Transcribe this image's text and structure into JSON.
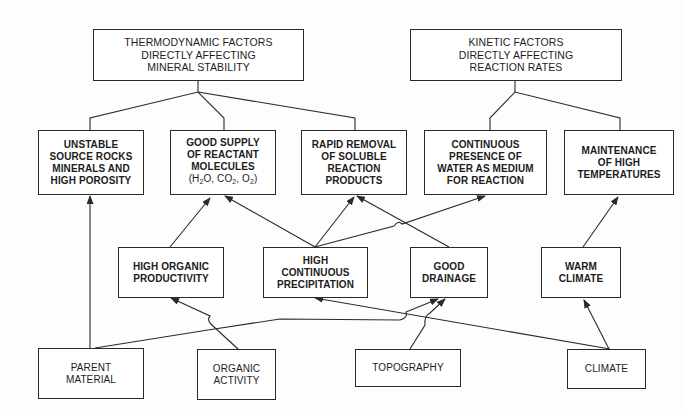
{
  "diagram": {
    "colors": {
      "line": "#2a2a2a",
      "text": "#1c1c1c",
      "background": "#fdfdfb"
    },
    "top": [
      {
        "id": "thermo",
        "lines": [
          "THERMODYNAMIC FACTORS",
          "DIRECTLY AFFECTING",
          "MINERAL STABILITY"
        ]
      },
      {
        "id": "kinetic",
        "lines": [
          "KINETIC FACTORS",
          "DIRECTLY AFFECTING",
          "REACTION RATES"
        ]
      }
    ],
    "factors": [
      {
        "id": "unstable",
        "lines": [
          "UNSTABLE",
          "SOURCE ROCKS",
          "MINERALS AND",
          "HIGH POROSITY"
        ]
      },
      {
        "id": "supply",
        "lines": [
          "GOOD SUPPLY",
          "OF REACTANT",
          "MOLECULES",
          "(H2O, CO2, O2)"
        ]
      },
      {
        "id": "removal",
        "lines": [
          "RAPID REMOVAL",
          "OF SOLUBLE",
          "REACTION",
          "PRODUCTS"
        ]
      },
      {
        "id": "water",
        "lines": [
          "CONTINUOUS",
          "PRESENCE OF",
          "WATER AS MEDIUM",
          "FOR REACTION"
        ]
      },
      {
        "id": "temp",
        "lines": [
          "MAINTENANCE",
          "OF HIGH",
          "TEMPERATURES"
        ]
      }
    ],
    "conditions": [
      {
        "id": "organic_prod",
        "lines": [
          "HIGH ORGANIC",
          "PRODUCTIVITY"
        ]
      },
      {
        "id": "precip",
        "lines": [
          "HIGH",
          "CONTINUOUS",
          "PRECIPITATION"
        ]
      },
      {
        "id": "drainage",
        "lines": [
          "GOOD",
          "DRAINAGE"
        ]
      },
      {
        "id": "warm",
        "lines": [
          "WARM",
          "CLIMATE"
        ]
      }
    ],
    "sources": [
      {
        "id": "parent",
        "lines": [
          "PARENT",
          "MATERIAL"
        ]
      },
      {
        "id": "organic",
        "lines": [
          "ORGANIC",
          "ACTIVITY"
        ]
      },
      {
        "id": "topo",
        "lines": [
          "TOPOGRAPHY"
        ]
      },
      {
        "id": "climate",
        "lines": [
          "CLIMATE"
        ]
      }
    ],
    "edges": [
      {
        "from": "thermo",
        "to": "unstable",
        "type": "line"
      },
      {
        "from": "thermo",
        "to": "supply",
        "type": "line"
      },
      {
        "from": "thermo",
        "to": "removal",
        "type": "line"
      },
      {
        "from": "kinetic",
        "to": "water",
        "type": "line"
      },
      {
        "from": "kinetic",
        "to": "temp",
        "type": "line"
      },
      {
        "from": "parent",
        "to": "unstable",
        "type": "arrow"
      },
      {
        "from": "organic_prod",
        "to": "supply",
        "type": "arrow"
      },
      {
        "from": "precip",
        "to": "supply",
        "type": "arrow"
      },
      {
        "from": "precip",
        "to": "removal",
        "type": "arrow"
      },
      {
        "from": "precip",
        "to": "water",
        "type": "arrow"
      },
      {
        "from": "drainage",
        "to": "removal",
        "type": "arrow"
      },
      {
        "from": "warm",
        "to": "temp",
        "type": "arrow"
      },
      {
        "from": "organic",
        "to": "organic_prod",
        "type": "arrow"
      },
      {
        "from": "parent",
        "to": "drainage",
        "type": "arrow"
      },
      {
        "from": "topo",
        "to": "drainage",
        "type": "arrow"
      },
      {
        "from": "climate",
        "to": "precip",
        "type": "arrow"
      },
      {
        "from": "climate",
        "to": "warm",
        "type": "arrow"
      }
    ]
  }
}
